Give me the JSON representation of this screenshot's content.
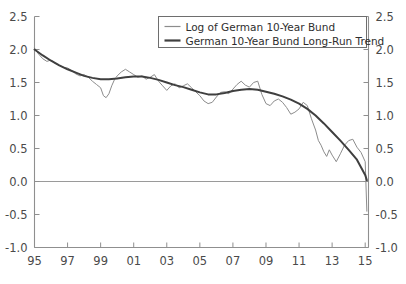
{
  "chart_data": {
    "type": "line",
    "title": "",
    "subtitle": "",
    "xlabel": "",
    "ylabel": "",
    "xlim": [
      1995.0,
      2015.2
    ],
    "ylim": [
      -1.0,
      2.5
    ],
    "grid": false,
    "zero_line": true,
    "dual_y_axis": true,
    "legend_position": "top-center",
    "x_tick_labels": [
      "95",
      "97",
      "99",
      "01",
      "03",
      "05",
      "07",
      "09",
      "11",
      "13",
      "15"
    ],
    "x_tick_values": [
      1995,
      1997,
      1999,
      2001,
      2003,
      2005,
      2007,
      2009,
      2011,
      2013,
      2015
    ],
    "y_tick_labels_left": [
      "2.5",
      "2.0",
      "1.5",
      "1.0",
      "0.5",
      "0.0",
      "-0.5",
      "-1.0"
    ],
    "y_tick_labels_right": [
      "2.5",
      "2.0",
      "1.5",
      "1.0",
      "0.5",
      "0.0",
      "-0.5",
      "-1.0"
    ],
    "y_tick_values": [
      2.5,
      2.0,
      1.5,
      1.0,
      0.5,
      0.0,
      -0.5,
      -1.0
    ],
    "series": [
      {
        "name": "Log of German 10-Year Bund",
        "color": "#8c8c8c",
        "width": 1,
        "x": [
          1995.0,
          1995.25,
          1995.5,
          1995.75,
          1996.0,
          1996.25,
          1996.5,
          1996.75,
          1997.0,
          1997.25,
          1997.5,
          1997.75,
          1998.0,
          1998.25,
          1998.5,
          1998.75,
          1999.0,
          1999.17,
          1999.33,
          1999.5,
          1999.67,
          1999.83,
          2000.0,
          2000.25,
          2000.5,
          2000.75,
          2001.0,
          2001.25,
          2001.5,
          2001.75,
          2002.0,
          2002.25,
          2002.5,
          2002.75,
          2003.0,
          2003.25,
          2003.5,
          2003.75,
          2004.0,
          2004.25,
          2004.5,
          2004.75,
          2005.0,
          2005.25,
          2005.5,
          2005.75,
          2006.0,
          2006.25,
          2006.5,
          2006.75,
          2007.0,
          2007.25,
          2007.5,
          2007.75,
          2008.0,
          2008.25,
          2008.5,
          2008.75,
          2009.0,
          2009.25,
          2009.5,
          2009.75,
          2010.0,
          2010.25,
          2010.5,
          2010.75,
          2011.0,
          2011.25,
          2011.5,
          2011.75,
          2012.0,
          2012.17,
          2012.33,
          2012.5,
          2012.67,
          2012.83,
          2013.0,
          2013.25,
          2013.5,
          2013.75,
          2014.0,
          2014.25,
          2014.5,
          2014.75,
          2015.0,
          2015.1
        ],
        "y": [
          2.02,
          1.93,
          1.86,
          1.82,
          1.84,
          1.79,
          1.76,
          1.73,
          1.72,
          1.68,
          1.63,
          1.6,
          1.62,
          1.58,
          1.52,
          1.47,
          1.42,
          1.3,
          1.27,
          1.33,
          1.45,
          1.54,
          1.6,
          1.66,
          1.7,
          1.66,
          1.62,
          1.58,
          1.6,
          1.55,
          1.58,
          1.62,
          1.52,
          1.45,
          1.38,
          1.45,
          1.48,
          1.42,
          1.45,
          1.48,
          1.42,
          1.36,
          1.3,
          1.22,
          1.18,
          1.2,
          1.28,
          1.35,
          1.36,
          1.33,
          1.4,
          1.47,
          1.52,
          1.46,
          1.43,
          1.5,
          1.52,
          1.32,
          1.18,
          1.15,
          1.22,
          1.25,
          1.2,
          1.12,
          1.02,
          1.05,
          1.1,
          1.2,
          1.15,
          0.95,
          0.78,
          0.62,
          0.55,
          0.45,
          0.38,
          0.48,
          0.4,
          0.3,
          0.42,
          0.55,
          0.62,
          0.64,
          0.52,
          0.44,
          0.3,
          -0.45
        ]
      },
      {
        "name": "German 10-Year Bund Long-Run Trend",
        "color": "#3f3f3f",
        "width": 2,
        "x": [
          1995.0,
          1995.5,
          1996.0,
          1996.5,
          1997.0,
          1997.5,
          1998.0,
          1998.5,
          1999.0,
          1999.5,
          2000.0,
          2000.5,
          2001.0,
          2001.5,
          2002.0,
          2002.5,
          2003.0,
          2003.5,
          2004.0,
          2004.5,
          2005.0,
          2005.5,
          2006.0,
          2006.5,
          2007.0,
          2007.5,
          2008.0,
          2008.5,
          2009.0,
          2009.5,
          2010.0,
          2010.5,
          2011.0,
          2011.5,
          2012.0,
          2012.5,
          2013.0,
          2013.5,
          2014.0,
          2014.5,
          2015.0,
          2015.1
        ],
        "y": [
          2.0,
          1.91,
          1.83,
          1.76,
          1.7,
          1.65,
          1.6,
          1.57,
          1.55,
          1.55,
          1.56,
          1.58,
          1.59,
          1.59,
          1.57,
          1.54,
          1.5,
          1.46,
          1.43,
          1.39,
          1.35,
          1.32,
          1.32,
          1.34,
          1.37,
          1.39,
          1.4,
          1.39,
          1.36,
          1.33,
          1.29,
          1.24,
          1.18,
          1.1,
          1.0,
          0.88,
          0.75,
          0.62,
          0.48,
          0.33,
          0.1,
          0.02
        ]
      }
    ]
  },
  "legend": {
    "entries": [
      {
        "label": "Log of German 10-Year Bund",
        "swatch": "thin-gray-line"
      },
      {
        "label": "German 10-Year Bund Long-Run Trend",
        "swatch": "thick-dark-line"
      }
    ]
  },
  "colors": {
    "series_thin": "#8c8c8c",
    "series_thick": "#3f3f3f",
    "axis": "#8f8f8f",
    "zero_line": "#9a9a9a",
    "text": "#4a4a4a",
    "background": "#ffffff",
    "legend_border": "#6e6e6e"
  }
}
